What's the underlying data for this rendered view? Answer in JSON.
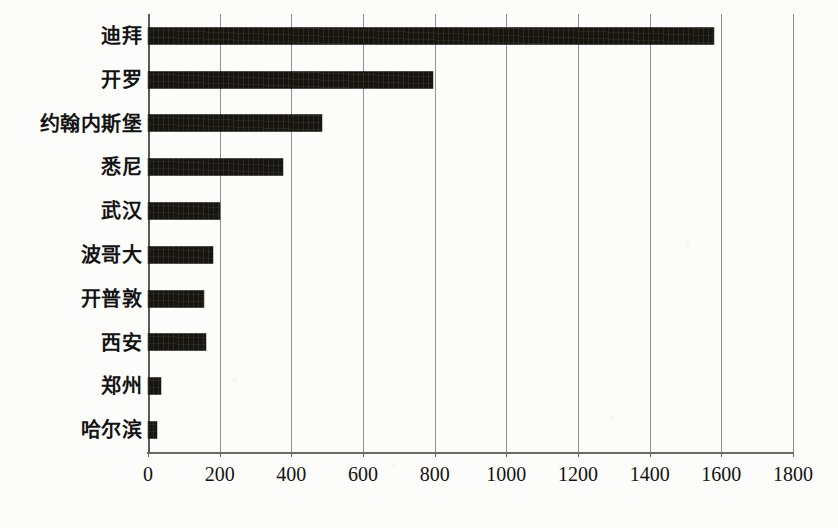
{
  "chart_data": {
    "type": "bar",
    "orientation": "horizontal",
    "title": "",
    "subtitle": "",
    "xlabel": "",
    "ylabel": "",
    "categories": [
      "迪拜",
      "开罗",
      "约翰内斯堡",
      "悉尼",
      "武汉",
      "波哥大",
      "开普敦",
      "西安",
      "郑州",
      "哈尔滨"
    ],
    "values": [
      1580,
      795,
      485,
      378,
      200,
      180,
      157,
      162,
      36,
      25
    ],
    "xlim": [
      0,
      1800
    ],
    "ylim": null,
    "xticks": [
      0,
      200,
      400,
      600,
      800,
      1000,
      1200,
      1400,
      1600,
      1800
    ],
    "xtick_labels": [
      "0",
      "200",
      "400",
      "600",
      "800",
      "1000",
      "1200",
      "1400",
      "1600",
      "1800"
    ],
    "grid": "vertical",
    "legend": null,
    "legend_position": "none",
    "bar_color": "#17150f",
    "gridline_color": "#8f8f8f",
    "axis_color": "#5a5a5a",
    "background_color": "#fcfcfa",
    "annotations": []
  }
}
